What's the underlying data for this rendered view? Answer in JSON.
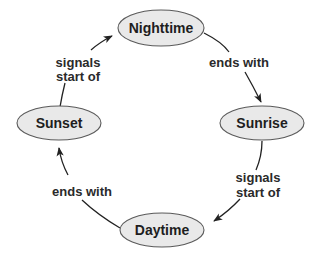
{
  "diagram": {
    "type": "cycle",
    "nodes": {
      "nighttime": {
        "label": "Nighttime"
      },
      "sunrise": {
        "label": "Sunrise"
      },
      "daytime": {
        "label": "Daytime"
      },
      "sunset": {
        "label": "Sunset"
      }
    },
    "edges": {
      "nighttime_to_sunrise": {
        "from": "Nighttime",
        "to": "Sunrise",
        "label": "ends with"
      },
      "sunrise_to_daytime": {
        "from": "Sunrise",
        "to": "Daytime",
        "label_line1": "signals",
        "label_line2": "start of"
      },
      "daytime_to_sunset": {
        "from": "Daytime",
        "to": "Sunset",
        "label": "ends with"
      },
      "sunset_to_nighttime": {
        "from": "Sunset",
        "to": "Nighttime",
        "label_line1": "signals",
        "label_line2": "start of"
      }
    },
    "colors": {
      "node_fill": "#e9e9e9",
      "node_stroke": "#5a5a5a",
      "edge_stroke": "#222222",
      "text": "#1e1e1e"
    }
  }
}
